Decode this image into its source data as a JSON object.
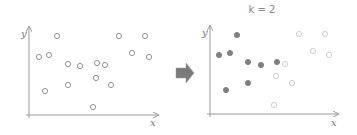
{
  "diagram": {
    "title": "k = 2",
    "left_panel": {
      "x_label": "x",
      "y_label": "y",
      "points": [
        {
          "x": 57,
          "y": 36
        },
        {
          "x": 39,
          "y": 57
        },
        {
          "x": 49,
          "y": 55
        },
        {
          "x": 68,
          "y": 64
        },
        {
          "x": 80,
          "y": 66
        },
        {
          "x": 97,
          "y": 63
        },
        {
          "x": 105,
          "y": 65
        },
        {
          "x": 96,
          "y": 78
        },
        {
          "x": 68,
          "y": 85
        },
        {
          "x": 45,
          "y": 91
        },
        {
          "x": 111,
          "y": 85
        },
        {
          "x": 93,
          "y": 107
        },
        {
          "x": 119,
          "y": 36
        },
        {
          "x": 145,
          "y": 36
        },
        {
          "x": 132,
          "y": 53
        },
        {
          "x": 149,
          "y": 57
        }
      ]
    },
    "right_panel": {
      "x_label": "x",
      "y_label": "y",
      "clusters": [
        {
          "name": "cluster-1",
          "style": "filled",
          "color": "#808080",
          "points": [
            {
              "x": 57,
              "y": 35
            },
            {
              "x": 39,
              "y": 55
            },
            {
              "x": 50,
              "y": 53
            },
            {
              "x": 68,
              "y": 62
            },
            {
              "x": 81,
              "y": 65
            },
            {
              "x": 97,
              "y": 62
            },
            {
              "x": 68,
              "y": 83
            },
            {
              "x": 46,
              "y": 90
            }
          ]
        },
        {
          "name": "cluster-2",
          "style": "hollow",
          "color": "#c8c8c8",
          "points": [
            {
              "x": 105,
              "y": 64
            },
            {
              "x": 96,
              "y": 76
            },
            {
              "x": 112,
              "y": 83
            },
            {
              "x": 94,
              "y": 105
            },
            {
              "x": 119,
              "y": 34
            },
            {
              "x": 145,
              "y": 34
            },
            {
              "x": 133,
              "y": 51
            },
            {
              "x": 149,
              "y": 55
            }
          ]
        }
      ]
    },
    "arrow": {
      "icon": "right-arrow-icon",
      "color": "#7a7a7a"
    },
    "colors": {
      "axis": "#9a9a9a",
      "left_points": "#888888"
    }
  }
}
